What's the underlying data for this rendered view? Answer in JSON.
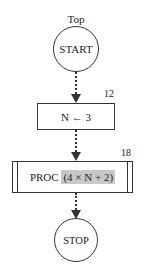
{
  "diagram": {
    "type": "flowchart",
    "title": "Top",
    "nodes": [
      {
        "id": "start",
        "shape": "circle",
        "label": "START"
      },
      {
        "id": "assign",
        "shape": "rectangle",
        "label": "N ← 3",
        "annotation": "12"
      },
      {
        "id": "proc",
        "shape": "predefined-process",
        "label_prefix": "PROC",
        "label_argument": "(4 × N + 2)",
        "annotation": "18"
      },
      {
        "id": "stop",
        "shape": "circle",
        "label": "STOP"
      }
    ],
    "edges": [
      {
        "from": "start",
        "to": "assign",
        "style": "dotted-arrow"
      },
      {
        "from": "assign",
        "to": "proc",
        "style": "dotted-arrow"
      },
      {
        "from": "proc",
        "to": "stop",
        "style": "dotted-arrow"
      }
    ],
    "colors": {
      "stroke": "#333333",
      "highlight": "#c8c8c8",
      "background": "#ffffff"
    }
  }
}
